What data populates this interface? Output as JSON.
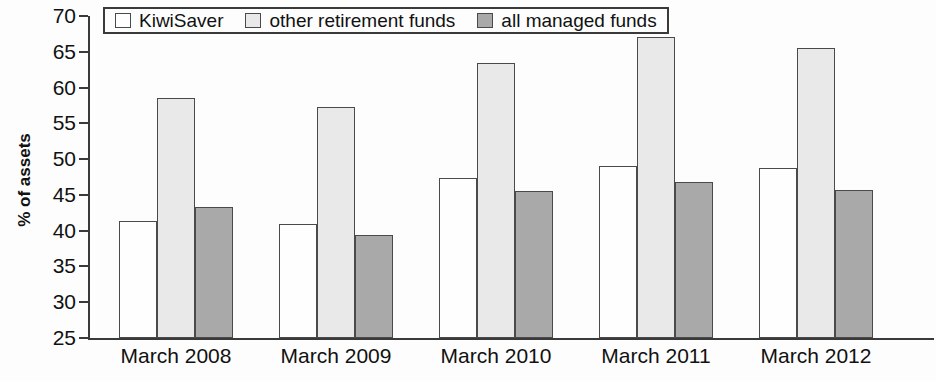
{
  "chart_data": {
    "type": "bar",
    "title": "",
    "subtitle": "",
    "xlabel": "",
    "ylabel": "% of assets",
    "ylim": [
      25,
      70
    ],
    "ytick_step": 5,
    "yticks": [
      70,
      65,
      60,
      55,
      50,
      45,
      40,
      35,
      30,
      25
    ],
    "grid": false,
    "legend_position": "top-left",
    "categories": [
      "March 2008",
      "March 2009",
      "March 2010",
      "March 2011",
      "March 2012"
    ],
    "series": [
      {
        "name": "KiwiSaver",
        "color": "#fefefe",
        "values": [
          41.4,
          41.0,
          47.4,
          49.1,
          48.8
        ]
      },
      {
        "name": "other retirement funds",
        "color": "#e9e9e9",
        "values": [
          58.5,
          57.3,
          63.5,
          67.1,
          65.6
        ]
      },
      {
        "name": "all managed funds",
        "color": "#a9a9a9",
        "values": [
          43.3,
          39.4,
          45.5,
          46.8,
          45.7
        ]
      }
    ]
  },
  "legend": {
    "items": [
      {
        "label": "KiwiSaver",
        "swatch": "kiwisaver"
      },
      {
        "label": "other retirement funds",
        "swatch": "other"
      },
      {
        "label": "all managed funds",
        "swatch": "allmanaged"
      }
    ]
  },
  "axis": {
    "y_title": "% of assets"
  }
}
